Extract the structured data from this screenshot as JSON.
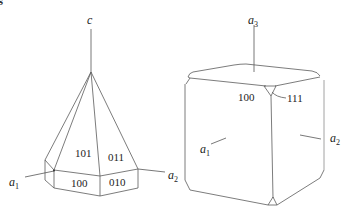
{
  "figure": {
    "partial_top_left_glyph": "s",
    "pyramid": {
      "axis_c_label": "c",
      "axis_a1": {
        "letter": "a",
        "sub": "1"
      },
      "axis_a2": {
        "letter": "a",
        "sub": "2"
      },
      "faces": {
        "f101": "101",
        "f011": "011",
        "f100": "100",
        "f010": "010"
      }
    },
    "cube": {
      "axis_a3": {
        "letter": "a",
        "sub": "3"
      },
      "axis_a1": {
        "letter": "a",
        "sub": "1"
      },
      "axis_a2": {
        "letter": "a",
        "sub": "2"
      },
      "faces": {
        "f100": "100",
        "f111": "111"
      }
    },
    "colors": {
      "line": "#5a5a5a",
      "text": "#222222",
      "background": "#ffffff"
    }
  }
}
